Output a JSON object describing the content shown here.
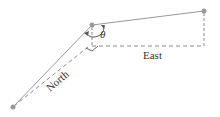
{
  "diagram": {
    "labels": {
      "north": "North",
      "east": "East",
      "angle": "θ"
    },
    "points": {
      "start": [
        13,
        107
      ],
      "middle": [
        92,
        25
      ],
      "end": [
        204,
        11
      ]
    },
    "colors": {
      "line": "#999999",
      "dashed": "#888888",
      "dot": "#999999",
      "text": "#333333"
    }
  }
}
